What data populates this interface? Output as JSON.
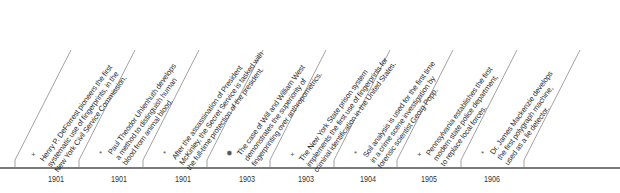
{
  "timeline": {
    "events": [
      {
        "year": "1901",
        "bullet": "+",
        "lines": [
          "Henry P. DeForrest pioneers the first",
          "systematic use of fingerprints, in the",
          "New York Civil Service Commission."
        ]
      },
      {
        "year": "1901",
        "bullet": "*",
        "lines": [
          "Paul Theodor Uhlenhuth develops",
          "a method to distinguish human",
          "blood from animal blood."
        ]
      },
      {
        "year": "1901",
        "bullet": "*",
        "lines": [
          "After the assassination of President",
          "McKinley, the Secret Service is tasked with",
          "the full-time protection of the president."
        ]
      },
      {
        "year": "1903",
        "bullet": "✹",
        "lines": [
          "The case of Will and William West",
          "demonstrates the superiority of",
          "fingerprinting over anthropometrics."
        ]
      },
      {
        "year": "1903",
        "bullet": "+",
        "lines": [
          "The New York State prison system",
          "implements the first use of fingerprints for",
          "criminal identification in the United States."
        ]
      },
      {
        "year": "1904",
        "bullet": "*",
        "lines": [
          "Soil analysis is used for the first time",
          "in a crime scene investigation by",
          "forensic scientist Georg Popp."
        ]
      },
      {
        "year": "1905",
        "bullet": "+",
        "lines": [
          "Pennsylvania establishes the first",
          "modern state police department,",
          "to replace local forces."
        ]
      },
      {
        "year": "1906",
        "bullet": "*",
        "lines": [
          "Dr. James Mackenzie develops",
          "the first polygraph machine,",
          "used as a lie detector."
        ]
      }
    ],
    "colors": {
      "axis": "#7a7a7a",
      "divider": "#8a8a8a",
      "text": "#2a2a2a"
    }
  }
}
